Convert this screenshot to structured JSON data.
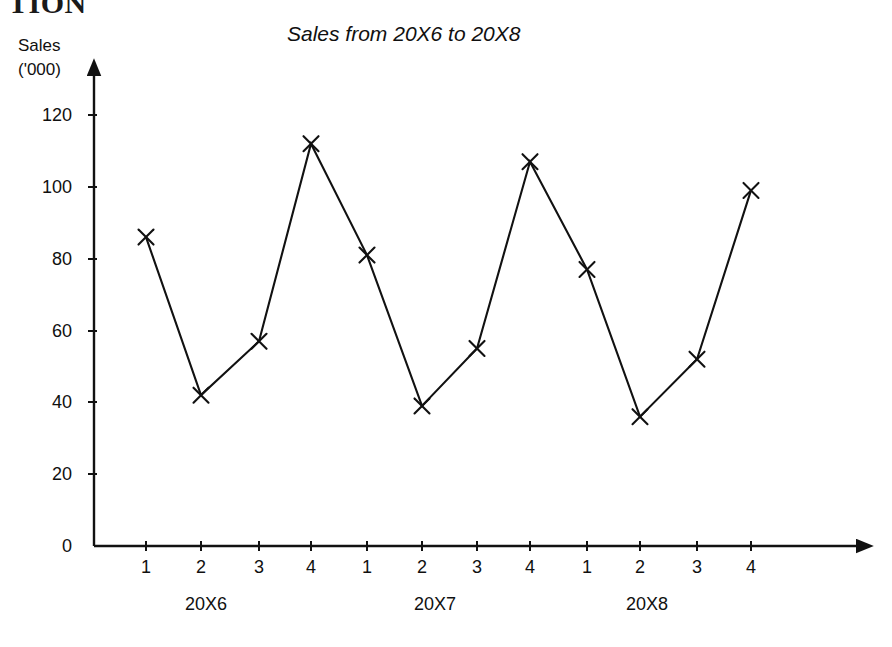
{
  "page": {
    "cropped_heading": "TION",
    "background_color": "#ffffff",
    "ink_color": "#111111"
  },
  "chart_data": {
    "type": "line",
    "title": "Sales from 20X6 to 20X8",
    "ylabel_line1": "Sales",
    "ylabel_line2": "('000)",
    "xlabel": "",
    "grid": false,
    "legend": "none",
    "marker": "x",
    "ylim": [
      0,
      130
    ],
    "yticks": [
      0,
      20,
      40,
      60,
      80,
      100,
      120
    ],
    "ytick_labels": [
      "0",
      "20",
      "40",
      "60",
      "80",
      "100",
      "120"
    ],
    "categories": [
      "1",
      "2",
      "3",
      "4",
      "1",
      "2",
      "3",
      "4",
      "1",
      "2",
      "3",
      "4"
    ],
    "values": [
      86,
      42,
      57,
      112,
      81,
      39,
      55,
      107,
      77,
      36,
      52,
      99
    ],
    "groups": [
      {
        "label": "20X6",
        "quarters": [
          "1",
          "2",
          "3",
          "4"
        ],
        "values": [
          86,
          42,
          57,
          112
        ]
      },
      {
        "label": "20X7",
        "quarters": [
          "1",
          "2",
          "3",
          "4"
        ],
        "values": [
          81,
          39,
          55,
          107
        ]
      },
      {
        "label": "20X8",
        "quarters": [
          "1",
          "2",
          "3",
          "4"
        ],
        "values": [
          77,
          36,
          52,
          99
        ]
      }
    ]
  },
  "axes": {
    "y_arrow": "up-arrow-icon",
    "x_arrow": "right-arrow-icon"
  }
}
